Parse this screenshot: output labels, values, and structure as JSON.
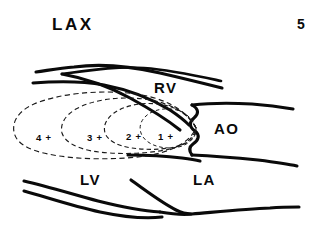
{
  "figure": {
    "view_label": "LAX",
    "page_number": "5",
    "caption_absent": true,
    "background_color": "#ffffff",
    "ink_color": "#0a0a0a"
  },
  "chambers": [
    {
      "id": "rv",
      "label": "RV",
      "x": 154,
      "y": 80
    },
    {
      "id": "ao",
      "label": "AO",
      "x": 214,
      "y": 121
    },
    {
      "id": "lv",
      "label": "LV",
      "x": 80,
      "y": 172
    },
    {
      "id": "la",
      "label": "LA",
      "x": 193,
      "y": 172
    }
  ],
  "jet_grades": [
    {
      "id": "grade-4",
      "label": "4 +",
      "x": 36,
      "y": 133,
      "contour": "dashed"
    },
    {
      "id": "grade-3",
      "label": "3 +",
      "x": 87,
      "y": 133,
      "contour": "dashed"
    },
    {
      "id": "grade-2",
      "label": "2 +",
      "x": 126,
      "y": 132,
      "contour": "dashed"
    },
    {
      "id": "grade-1",
      "label": "1 +",
      "x": 158,
      "y": 132,
      "contour": "dashed"
    }
  ]
}
